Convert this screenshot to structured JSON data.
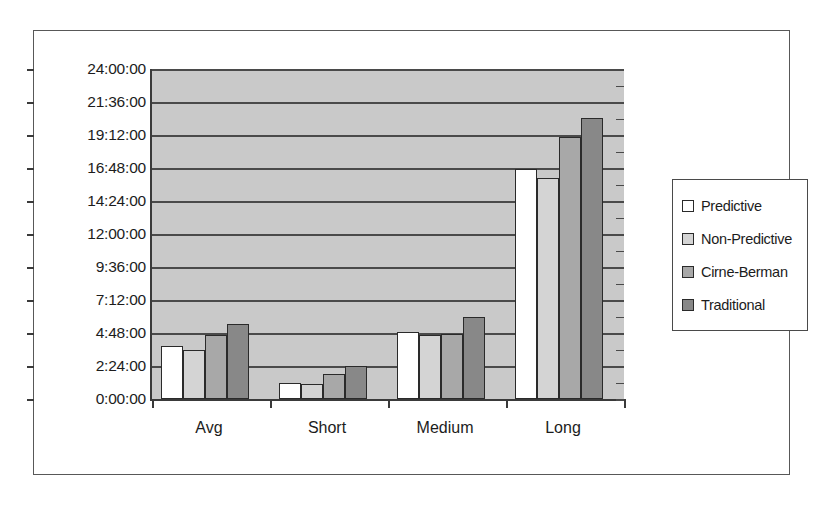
{
  "chart_data": {
    "type": "bar",
    "title": "",
    "subtitle": "",
    "xlabel": "",
    "ylabel": "",
    "grid": true,
    "legend_position": "right",
    "categories": [
      "Avg",
      "Short",
      "Medium",
      "Long"
    ],
    "y_tick_labels": [
      "0:00:00",
      "2:24:00",
      "4:48:00",
      "7:12:00",
      "9:36:00",
      "12:00:00",
      "14:24:00",
      "16:48:00",
      "19:12:00",
      "21:36:00",
      "24:00:00"
    ],
    "y_tick_values_hours": [
      0,
      2.4,
      4.8,
      7.2,
      9.6,
      12,
      14.4,
      16.8,
      19.2,
      21.6,
      24
    ],
    "ylim_hours": [
      0,
      24
    ],
    "y_axis_format": "h:mm:ss",
    "series": [
      {
        "name": "Predictive",
        "color": "#ffffff",
        "values_hours": [
          3.83,
          1.17,
          4.87,
          16.75
        ],
        "values_time": [
          "3:50:00",
          "1:10:00",
          "4:52:00",
          "16:45:00"
        ]
      },
      {
        "name": "Non-Predictive",
        "color": "#d4d4d4",
        "values_hours": [
          3.6,
          1.08,
          4.67,
          16.08
        ],
        "values_time": [
          "3:36:00",
          "1:05:00",
          "4:40:00",
          "16:05:00"
        ]
      },
      {
        "name": "Cirne-Berman",
        "color": "#a8a8a8",
        "values_hours": [
          4.67,
          1.83,
          4.75,
          19.08
        ],
        "values_time": [
          "4:40:00",
          "1:50:00",
          "4:45:00",
          "19:05:00"
        ]
      },
      {
        "name": "Traditional",
        "color": "#888888",
        "values_hours": [
          5.42,
          2.37,
          6.0,
          20.42
        ],
        "values_time": [
          "5:25:00",
          "2:22:00",
          "6:00:00",
          "20:25:00"
        ]
      }
    ]
  },
  "legend": {
    "items": [
      {
        "label": "Predictive"
      },
      {
        "label": "Non-Predictive"
      },
      {
        "label": "Cirne-Berman"
      },
      {
        "label": "Traditional"
      }
    ]
  },
  "colors": {
    "plot_background": "#c9c9c9",
    "gridline": "#4a4a4a",
    "axis": "#3a3a3a",
    "bar_outline": "#2a2a2a",
    "frame_border": "#585858",
    "text": "#1c1c1c",
    "page_background": "#ffffff"
  }
}
